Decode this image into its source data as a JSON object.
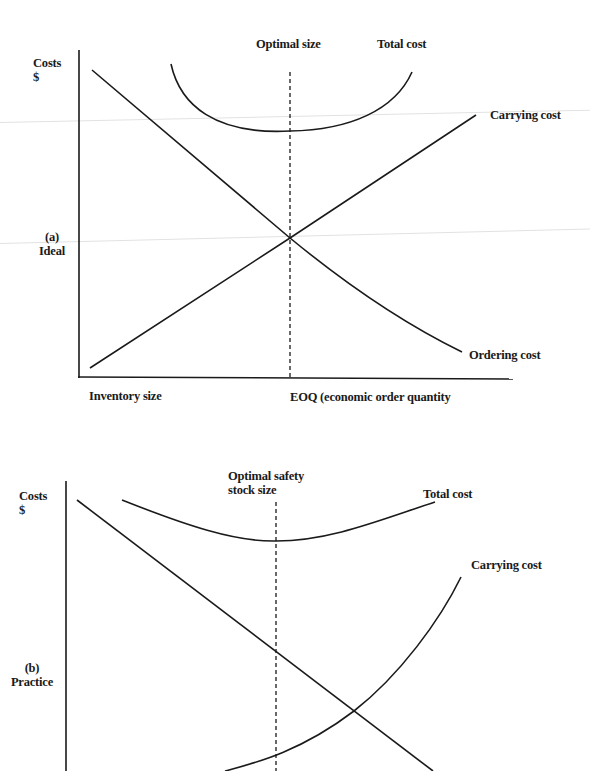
{
  "figure": {
    "panel_a": {
      "side_label_line1": "(a)",
      "side_label_line2": "Ideal",
      "y_axis_label_line1": "Costs",
      "y_axis_label_line2": "$",
      "optimal_marker_label": "Optimal size",
      "x_axis_left_label": "Inventory size",
      "x_axis_marker_label": "EOQ (economic order quantity",
      "curves": {
        "total_cost": "Total cost",
        "carrying_cost": "Carrying cost",
        "ordering_cost": "Ordering cost"
      }
    },
    "panel_b": {
      "side_label_line1": "(b)",
      "side_label_line2": "Practice",
      "y_axis_label_line1": "Costs",
      "y_axis_label_line2": "$",
      "optimal_marker_label_line1": "Optimal safety",
      "optimal_marker_label_line2": "stock size",
      "curves": {
        "total_cost": "Total cost",
        "carrying_cost": "Carrying cost"
      }
    },
    "colors": {
      "line": "#1a1a1a",
      "background": "#ffffff"
    }
  }
}
